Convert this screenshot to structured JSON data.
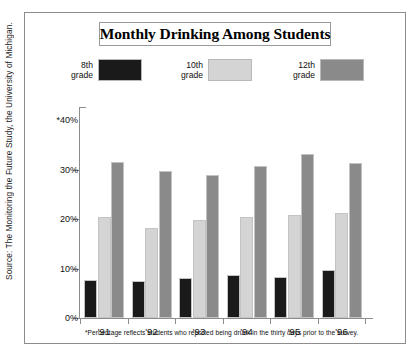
{
  "source_credit": "Source: The Monitoring the Future Study, the University of Michigan.",
  "title": "Monthly Drinking Among Students",
  "legend": [
    {
      "label": "8th\ngrade",
      "color": "#1a1a1a"
    },
    {
      "label": "10th\ngrade",
      "color": "#d4d4d4"
    },
    {
      "label": "12th\ngrade",
      "color": "#8a8a8a"
    }
  ],
  "y_axis": {
    "ticks": [
      {
        "label": "0%",
        "value": 0
      },
      {
        "label": "10%",
        "value": 10
      },
      {
        "label": "20%",
        "value": 20
      },
      {
        "label": "30%",
        "value": 30
      },
      {
        "label": "*40%",
        "value": 40
      }
    ]
  },
  "footnote": "*Percentage reflects students who reported being drunk in the thirty days prior to the survey.",
  "chart_data": {
    "type": "bar",
    "title": "Monthly Drinking Among Students",
    "xlabel": "",
    "ylabel": "",
    "ylim": [
      0,
      40
    ],
    "grid": false,
    "legend_position": "top",
    "categories": [
      "'91",
      "'92",
      "'93",
      "'94",
      "'95",
      "'96"
    ],
    "series": [
      {
        "name": "8th grade",
        "color": "#1a1a1a",
        "values": [
          7.6,
          7.5,
          8.0,
          8.7,
          8.3,
          9.6
        ]
      },
      {
        "name": "10th grade",
        "color": "#d4d4d4",
        "values": [
          20.5,
          18.1,
          19.8,
          20.4,
          20.8,
          21.3
        ]
      },
      {
        "name": "12th grade",
        "color": "#8a8a8a",
        "values": [
          31.6,
          29.8,
          28.9,
          30.8,
          33.2,
          31.3
        ]
      }
    ],
    "annotations": [
      "*Percentage reflects students who reported being drunk in the thirty days prior to the survey."
    ]
  }
}
